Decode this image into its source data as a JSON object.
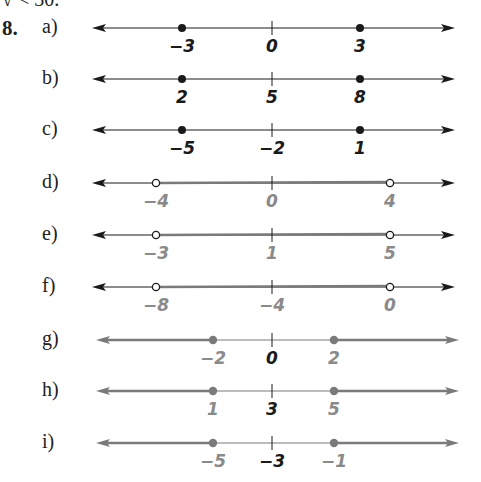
{
  "header": {
    "fragment": "√ < 30.",
    "problem_number": "8."
  },
  "colors": {
    "black": "#1a1a1a",
    "gray": "#7a7a7a",
    "gray_label": "#8a8a8a"
  },
  "rows": [
    {
      "label": "a)",
      "y": 28,
      "color": "black",
      "points": [
        -3,
        3
      ],
      "center": 0,
      "point_style": "closed",
      "labels": [
        "-3",
        "0",
        "3"
      ],
      "label_colors": [
        "black",
        "black",
        "black"
      ],
      "segment": "none"
    },
    {
      "label": "b)",
      "y": 79,
      "color": "black",
      "points": [
        2,
        8
      ],
      "center": 5,
      "point_style": "closed",
      "labels": [
        "2",
        "5",
        "8"
      ],
      "label_colors": [
        "black",
        "black",
        "black"
      ],
      "segment": "none"
    },
    {
      "label": "c)",
      "y": 130,
      "color": "black",
      "points": [
        -5,
        1
      ],
      "center": -2,
      "point_style": "closed",
      "labels": [
        "-5",
        "-2",
        "1"
      ],
      "label_colors": [
        "black",
        "black",
        "black"
      ],
      "segment": "none"
    },
    {
      "label": "d)",
      "y": 183,
      "color": "black",
      "points": [
        -4,
        4
      ],
      "center": 0,
      "point_style": "open",
      "labels": [
        "-4",
        "0",
        "4"
      ],
      "label_colors": [
        "gray",
        "gray",
        "gray"
      ],
      "segment": "between"
    },
    {
      "label": "e)",
      "y": 235,
      "color": "black",
      "points": [
        -3,
        5
      ],
      "center": 1,
      "point_style": "open",
      "labels": [
        "-3",
        "1",
        "5"
      ],
      "label_colors": [
        "gray",
        "gray",
        "gray"
      ],
      "segment": "between"
    },
    {
      "label": "f)",
      "y": 287,
      "color": "black",
      "points": [
        -8,
        0
      ],
      "center": -4,
      "point_style": "open",
      "labels": [
        "-8",
        "-4",
        "0"
      ],
      "label_colors": [
        "gray",
        "gray",
        "gray"
      ],
      "segment": "between"
    },
    {
      "label": "g)",
      "y": 340,
      "color": "gray",
      "points": [
        -2,
        2
      ],
      "center": 0,
      "point_style": "closed",
      "labels": [
        "-2",
        "0",
        "2"
      ],
      "label_colors": [
        "gray",
        "black",
        "gray"
      ],
      "segment": "outside"
    },
    {
      "label": "h)",
      "y": 391,
      "color": "gray",
      "points": [
        1,
        5
      ],
      "center": 3,
      "point_style": "closed",
      "labels": [
        "1",
        "3",
        "5"
      ],
      "label_colors": [
        "gray",
        "black",
        "gray"
      ],
      "segment": "outside"
    },
    {
      "label": "i)",
      "y": 443,
      "color": "gray",
      "points": [
        -5,
        -1
      ],
      "center": -3,
      "point_style": "closed",
      "labels": [
        "-5",
        "-3",
        "-1"
      ],
      "label_colors": [
        "gray",
        "black",
        "gray"
      ],
      "segment": "outside"
    }
  ]
}
